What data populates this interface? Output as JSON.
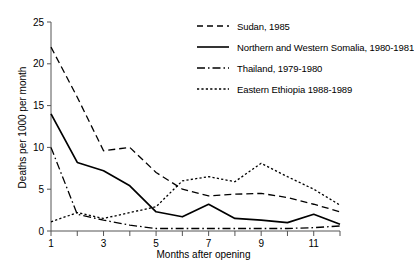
{
  "chart_data": {
    "type": "line",
    "title": "",
    "xlabel": "Months after opening",
    "ylabel": "Deaths per 1000 per month",
    "xlim": [
      1,
      12
    ],
    "ylim": [
      0,
      25
    ],
    "yticks": [
      0,
      5,
      10,
      15,
      20,
      25
    ],
    "xticks": [
      1,
      2,
      3,
      4,
      5,
      6,
      7,
      8,
      9,
      10,
      11,
      12
    ],
    "xtick_labels": [
      "1",
      "",
      "3",
      "",
      "5",
      "",
      "7",
      "",
      "9",
      "",
      "11",
      ""
    ],
    "ytick_labels": [
      "0",
      "5",
      "10",
      "15",
      "20",
      "25"
    ],
    "grid": false,
    "legend_position": "top-right",
    "x": [
      1,
      2,
      3,
      4,
      5,
      6,
      7,
      8,
      9,
      10,
      11,
      12
    ],
    "series": [
      {
        "name": "Sudan, 1985",
        "style": "dashed",
        "color": "#000000",
        "values": [
          22.0,
          16.0,
          9.6,
          10.0,
          7.0,
          5.0,
          4.2,
          4.4,
          4.5,
          4.0,
          3.2,
          2.3
        ]
      },
      {
        "name": "Northern and Western Somalia, 1980-1981",
        "style": "solid",
        "color": "#000000",
        "values": [
          14.0,
          8.2,
          7.2,
          5.4,
          2.3,
          1.7,
          3.2,
          1.5,
          1.3,
          1.0,
          2.0,
          0.8
        ]
      },
      {
        "name": "Thailand, 1979-1980",
        "style": "dash-dot",
        "color": "#000000",
        "values": [
          10.0,
          2.0,
          1.3,
          0.7,
          0.3,
          0.3,
          0.3,
          0.3,
          0.3,
          0.3,
          0.4,
          0.6
        ]
      },
      {
        "name": "Eastern Ethiopia 1988-1989",
        "style": "dotted",
        "color": "#000000",
        "values": [
          1.1,
          2.2,
          1.5,
          2.2,
          2.9,
          6.0,
          6.5,
          5.9,
          8.1,
          6.5,
          5.0,
          3.1
        ]
      }
    ]
  },
  "legend": {
    "items": [
      {
        "label": "Sudan, 1985",
        "style": "dashed"
      },
      {
        "label": "Northern and Western Somalia, 1980-1981",
        "style": "solid"
      },
      {
        "label": "Thailand, 1979-1980",
        "style": "dash-dot"
      },
      {
        "label": "Eastern Ethiopia 1988-1989",
        "style": "dotted"
      }
    ]
  },
  "axes": {
    "x_title": "Months after opening",
    "y_title": "Deaths per 1000 per month"
  }
}
